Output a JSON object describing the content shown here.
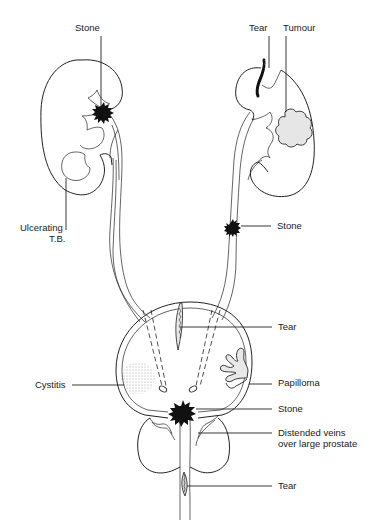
{
  "diagram": {
    "colors": {
      "line": "#222222",
      "background": "#ffffff",
      "stone_fill": "#111111",
      "tumour_fill": "#e6e6e6",
      "papilloma_fill": "#e8e8e8"
    },
    "labels": {
      "left_kidney_stone": "Stone",
      "ulcerating_tb_line1": "Ulcerating",
      "ulcerating_tb_line2": "T.B.",
      "right_kidney_tear": "Tear",
      "right_kidney_tumour": "Tumour",
      "ureter_stone": "Stone",
      "bladder_tear": "Tear",
      "cystitis": "Cystitis",
      "papilloma": "Papilloma",
      "bladder_stone": "Stone",
      "distended_veins_line1": "Distended veins",
      "distended_veins_line2": "over large prostate",
      "urethra_tear": "Tear"
    }
  }
}
